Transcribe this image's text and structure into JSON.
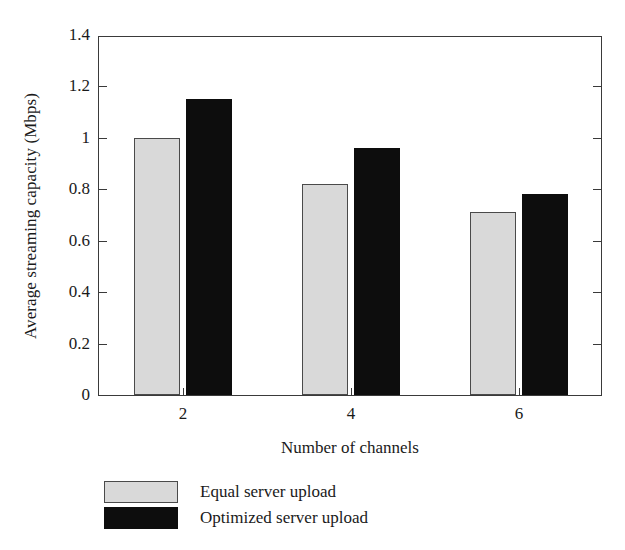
{
  "chart_data": {
    "type": "bar",
    "title": "",
    "xlabel": "Number of channels",
    "ylabel": "Average streaming capacity (Mbps)",
    "categories": [
      "2",
      "4",
      "6"
    ],
    "series": [
      {
        "name": "Equal server upload",
        "color": "#d9d9d9",
        "values": [
          1.0,
          0.82,
          0.71
        ]
      },
      {
        "name": "Optimized server upload",
        "color": "#0d0d0d",
        "values": [
          1.15,
          0.96,
          0.78
        ]
      }
    ],
    "ylim": [
      0,
      1.4
    ],
    "yticks": [
      0,
      0.2,
      0.4,
      0.6,
      0.8,
      1,
      1.2,
      1.4
    ],
    "ytick_labels": [
      "0",
      "0.2",
      "0.4",
      "0.6",
      "0.8",
      "1",
      "1.2",
      "1.4"
    ],
    "xtick_labels": [
      "2",
      "4",
      "6"
    ],
    "grid": false,
    "legend_position": "below-axes-left",
    "frame": "box"
  },
  "legend": {
    "items": [
      {
        "label": "Equal server upload",
        "swatch": "light-gray-swatch"
      },
      {
        "label": "Optimized server upload",
        "swatch": "black-swatch"
      }
    ]
  },
  "colors": {
    "series_equal": "#d9d9d9",
    "series_optimized": "#0d0d0d",
    "axis": "#3a3a3a",
    "text": "#1a1a1a",
    "background": "#ffffff"
  }
}
